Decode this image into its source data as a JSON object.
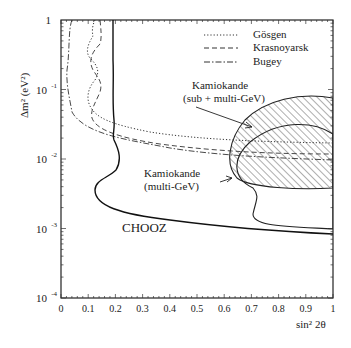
{
  "chart_data": {
    "type": "line",
    "title": "",
    "xlabel": "sin² 2θ",
    "ylabel": "Δm² (eV²)",
    "xlim": [
      0,
      1
    ],
    "ylim": [
      0.0001,
      1
    ],
    "yscale": "log",
    "grid": false,
    "legend_position": "upper right",
    "x_ticks": [
      "0",
      "0.1",
      "0.2",
      "0.3",
      "0.4",
      "0.5",
      "0.6",
      "0.7",
      "0.8",
      "0.9",
      "1"
    ],
    "y_ticks": [
      {
        "base": "1",
        "exp": ""
      },
      {
        "base": "10",
        "exp": "-1"
      },
      {
        "base": "10",
        "exp": "-2"
      },
      {
        "base": "10",
        "exp": "-3"
      },
      {
        "base": "10",
        "exp": "-4"
      }
    ],
    "legend": [
      {
        "label": "Gösgen",
        "style": "dotted"
      },
      {
        "label": "Krasnoyarsk",
        "style": "dashed"
      },
      {
        "label": "Bugey",
        "style": "dash-dot"
      }
    ],
    "series": [
      {
        "name": "CHOOZ",
        "style": "solid",
        "points": [
          [
            0.19,
            1
          ],
          [
            0.19,
            0.1
          ],
          [
            0.19,
            0.03
          ],
          [
            0.2,
            0.016
          ],
          [
            0.2,
            0.01
          ],
          [
            0.14,
            0.005
          ],
          [
            0.14,
            0.003
          ],
          [
            0.25,
            0.0018
          ],
          [
            0.5,
            0.0012
          ],
          [
            0.8,
            0.001
          ],
          [
            1,
            0.0009
          ]
        ]
      },
      {
        "name": "Gösgen",
        "style": "dotted",
        "points": [
          [
            0.12,
            1
          ],
          [
            0.09,
            0.5
          ],
          [
            0.15,
            0.2
          ],
          [
            0.08,
            0.1
          ],
          [
            0.1,
            0.05
          ],
          [
            0.2,
            0.025
          ],
          [
            0.5,
            0.02
          ],
          [
            1,
            0.019
          ]
        ]
      },
      {
        "name": "Krasnoyarsk",
        "style": "dashed",
        "points": [
          [
            0.14,
            1
          ],
          [
            0.15,
            0.5
          ],
          [
            0.09,
            0.25
          ],
          [
            0.14,
            0.12
          ],
          [
            0.1,
            0.05
          ],
          [
            0.2,
            0.022
          ],
          [
            0.5,
            0.013
          ],
          [
            1,
            0.012
          ]
        ]
      },
      {
        "name": "Bugey",
        "style": "dash-dot",
        "points": [
          [
            0.04,
            1
          ],
          [
            0.03,
            0.3
          ],
          [
            0.04,
            0.1
          ],
          [
            0.08,
            0.04
          ],
          [
            0.2,
            0.02
          ],
          [
            0.5,
            0.014
          ],
          [
            1,
            0.014
          ]
        ]
      }
    ],
    "regions": [
      {
        "name": "Kamiokande (sub + multi-GeV)",
        "style": "hatched",
        "dm2_range": [
          0.006,
          0.1
        ],
        "sin2_range": [
          0.55,
          1
        ]
      },
      {
        "name": "Kamiokande (multi-GeV)",
        "style": "solid-outline",
        "dm2_range": [
          0.0035,
          0.1
        ],
        "sin2_range": [
          0.6,
          1
        ]
      }
    ],
    "annotations": [
      {
        "text": "Kamiokande",
        "sub": "(sub + multi-GeV)",
        "arrow_to": [
          0.7,
          0.03
        ]
      },
      {
        "text": "Kamiokande",
        "sub": "(multi-GeV)",
        "arrow_to": [
          0.62,
          0.005
        ]
      },
      {
        "text": "CHOOZ"
      }
    ]
  }
}
